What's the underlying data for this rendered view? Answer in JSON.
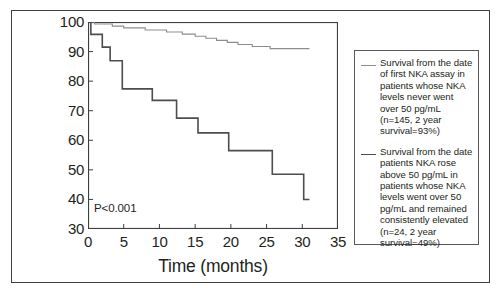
{
  "figure": {
    "pvalue_annotation": "P<0.001"
  },
  "axes": {
    "x_title": "Time (months)",
    "y_title": "Survival probability (%)",
    "x_ticks": [
      0,
      5,
      10,
      15,
      20,
      25,
      30,
      35
    ],
    "y_ticks": [
      30,
      40,
      50,
      60,
      70,
      80,
      90,
      100
    ]
  },
  "legend": {
    "entries": [
      {
        "swatch": "light",
        "label": "Survival from the date of first NKA assay in patients whose NKA levels never went over 50 pg/mL (n=145, 2 year survival=93%)"
      },
      {
        "swatch": "dark",
        "label": "Survival from the date patients NKA rose above 50 pg/mL in patients whose NKA levels went over 50 pg/mL and remained consistently elevated (n=24, 2 year survival=49%)"
      }
    ]
  },
  "chart_data": {
    "type": "line",
    "title": "",
    "subtitle": "",
    "xlabel": "Time (months)",
    "ylabel": "Survival probability (%)",
    "xlim": [
      0,
      35
    ],
    "ylim": [
      30,
      100
    ],
    "xticks": [
      0,
      5,
      10,
      15,
      20,
      25,
      30,
      35
    ],
    "yticks": [
      30,
      40,
      50,
      60,
      70,
      80,
      90,
      100
    ],
    "grid": false,
    "legend_position": "right-outside",
    "annotations": [
      {
        "text": "P<0.001",
        "x": 1.0,
        "y": 36.5
      }
    ],
    "curve_style": "kaplan-meier-step",
    "series": [
      {
        "name": "NKA never over 50 pg/mL (n=145, 2 year survival=93%)",
        "color": "#8d8d90",
        "n": 145,
        "two_year_survival": 93,
        "points": [
          {
            "x": 0.0,
            "y": 100.0
          },
          {
            "x": 0.9,
            "y": 99.3
          },
          {
            "x": 3.4,
            "y": 98.6
          },
          {
            "x": 5.0,
            "y": 98.0
          },
          {
            "x": 8.0,
            "y": 97.3
          },
          {
            "x": 11.0,
            "y": 96.6
          },
          {
            "x": 13.2,
            "y": 95.9
          },
          {
            "x": 15.0,
            "y": 95.2
          },
          {
            "x": 16.5,
            "y": 94.5
          },
          {
            "x": 18.0,
            "y": 93.8
          },
          {
            "x": 19.5,
            "y": 93.1
          },
          {
            "x": 21.0,
            "y": 92.4
          },
          {
            "x": 23.0,
            "y": 91.7
          },
          {
            "x": 25.5,
            "y": 91.0
          },
          {
            "x": 31.0,
            "y": 91.0
          }
        ]
      },
      {
        "name": "NKA rose above 50 pg/mL, consistently elevated (n=24, 2 year survival=49%)",
        "color": "#4d4d4f",
        "n": 24,
        "two_year_survival": 49,
        "points": [
          {
            "x": 0.0,
            "y": 100.0
          },
          {
            "x": 0.4,
            "y": 95.8
          },
          {
            "x": 1.6,
            "y": 95.8
          },
          {
            "x": 2.0,
            "y": 91.5
          },
          {
            "x": 2.7,
            "y": 91.5
          },
          {
            "x": 3.1,
            "y": 86.9
          },
          {
            "x": 4.4,
            "y": 86.9
          },
          {
            "x": 4.8,
            "y": 77.4
          },
          {
            "x": 8.6,
            "y": 77.4
          },
          {
            "x": 9.0,
            "y": 73.5
          },
          {
            "x": 12.0,
            "y": 73.5
          },
          {
            "x": 12.4,
            "y": 67.5
          },
          {
            "x": 15.0,
            "y": 67.5
          },
          {
            "x": 15.4,
            "y": 62.5
          },
          {
            "x": 19.3,
            "y": 62.5
          },
          {
            "x": 19.7,
            "y": 56.5
          },
          {
            "x": 25.4,
            "y": 56.5
          },
          {
            "x": 25.8,
            "y": 48.5
          },
          {
            "x": 30.0,
            "y": 48.5
          },
          {
            "x": 30.2,
            "y": 40.0
          },
          {
            "x": 31.0,
            "y": 40.0
          }
        ]
      }
    ]
  }
}
